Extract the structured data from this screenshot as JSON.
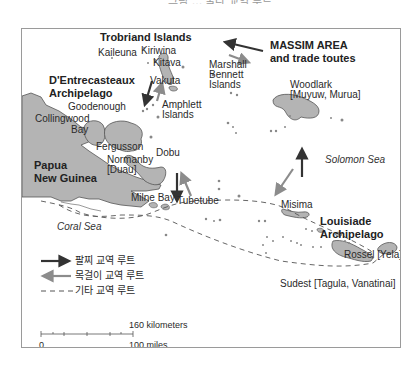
{
  "figure": {
    "title_partial": "그림 … 쿨라 교역 루트"
  },
  "map": {
    "heading": {
      "line1": "MASSIM AREA",
      "line2": "and trade toutes"
    },
    "regions": {
      "trobriand": "Trobriand Islands",
      "dentrecasteaux_1": "D'Entrecasteaux",
      "dentrecasteaux_2": "Archipelago",
      "png_1": "Papua",
      "png_2": "New Guinea",
      "louisiade_1": "Louisiade",
      "louisiade_2": "Archipelago"
    },
    "places": {
      "kaileuna": "Kaileuna",
      "kiriwina": "Kiriwina",
      "kitava": "Kitava",
      "vakuta": "Vakuta",
      "marshall_1": "Marshall",
      "marshall_2": "Bennett",
      "marshall_3": "Islands",
      "woodlark_1": "Woodlark",
      "woodlark_2": "[Muyuw, Murua]",
      "goodenough": "Goodenough",
      "collingwood_1": "Collingwood",
      "collingwood_2": "Bay",
      "amphlett_1": "Amphlett",
      "amphlett_2": "Islands",
      "fergusson": "Fergusson",
      "dobu": "Dobu",
      "normanby_1": "Normanby",
      "normanby_2": "[Duau]",
      "milne_bay": "Milne Bay",
      "tubetube": "Tubetube",
      "misima": "Misima",
      "rossel": "Rossel [Yela]",
      "sudest": "Sudest [Tagula, Vanatinai]"
    },
    "seas": {
      "coral": "Coral Sea",
      "solomon": "Solomon Sea"
    },
    "colors": {
      "land": "#b4b4b4",
      "land_outline": "#555555",
      "bracelet_arrow": "#333333",
      "necklace_arrow": "#8c8c8c",
      "other_route": "#555555"
    }
  },
  "legend": {
    "items": [
      {
        "symbol": "dark-arrow-right",
        "label": "팔찌 교역 루트"
      },
      {
        "symbol": "gray-arrow-left",
        "label": "목걸이 교역 루트"
      },
      {
        "symbol": "dashed-line",
        "label": "기타 교역 루트"
      }
    ]
  },
  "scale": {
    "km_label": "160 kilometers",
    "zero": "0",
    "miles_label": "100 miles"
  }
}
